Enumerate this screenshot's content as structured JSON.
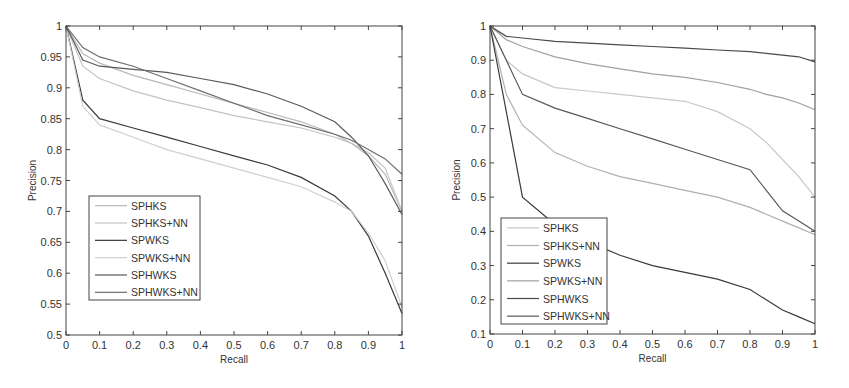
{
  "chart_data": [
    {
      "type": "line",
      "title": "",
      "xlabel": "Recall",
      "ylabel": "Precision",
      "xlim": [
        0,
        1
      ],
      "ylim": [
        0.5,
        1
      ],
      "grid": false,
      "legend_position": "lower left",
      "x": [
        0,
        0.05,
        0.1,
        0.2,
        0.3,
        0.4,
        0.5,
        0.6,
        0.7,
        0.8,
        0.85,
        0.9,
        0.95,
        1.0
      ],
      "xticks": [
        "0",
        "0.1",
        "0.2",
        "0.3",
        "0.4",
        "0.5",
        "0.6",
        "0.7",
        "0.8",
        "0.9",
        "1"
      ],
      "yticks": [
        "0.5",
        "0.55",
        "0.6",
        "0.65",
        "0.7",
        "0.75",
        "0.8",
        "0.85",
        "0.9",
        "0.95",
        "1"
      ],
      "series": [
        {
          "name": "SPHKS",
          "color": "#b8b8b8",
          "values": [
            1.0,
            0.955,
            0.94,
            0.92,
            0.905,
            0.89,
            0.875,
            0.86,
            0.845,
            0.825,
            0.81,
            0.79,
            0.76,
            0.7
          ]
        },
        {
          "name": "SPHKS+NN",
          "color": "#c4c4c4",
          "values": [
            1.0,
            0.935,
            0.915,
            0.895,
            0.88,
            0.868,
            0.855,
            0.845,
            0.835,
            0.82,
            0.81,
            0.795,
            0.77,
            0.7
          ]
        },
        {
          "name": "SPWKS",
          "color": "#3a3a3a",
          "values": [
            1.0,
            0.88,
            0.85,
            0.835,
            0.82,
            0.805,
            0.79,
            0.775,
            0.755,
            0.725,
            0.7,
            0.66,
            0.6,
            0.535
          ]
        },
        {
          "name": "SPWKS+NN",
          "color": "#cfcfcf",
          "values": [
            1.0,
            0.87,
            0.84,
            0.82,
            0.8,
            0.785,
            0.77,
            0.755,
            0.74,
            0.715,
            0.7,
            0.665,
            0.62,
            0.545
          ]
        },
        {
          "name": "SPHWKS",
          "color": "#5a5a5a",
          "values": [
            1.0,
            0.945,
            0.935,
            0.93,
            0.925,
            0.915,
            0.905,
            0.89,
            0.87,
            0.845,
            0.82,
            0.79,
            0.745,
            0.695
          ]
        },
        {
          "name": "SPHWKS+NN",
          "color": "#6e6e6e",
          "values": [
            1.0,
            0.965,
            0.95,
            0.935,
            0.915,
            0.895,
            0.875,
            0.855,
            0.84,
            0.825,
            0.815,
            0.8,
            0.785,
            0.76
          ]
        }
      ],
      "legend": [
        "SPHKS",
        "SPHKS+NN",
        "SPWKS",
        "SPWKS+NN",
        "SPHWKS",
        "SPHWKS+NN"
      ]
    },
    {
      "type": "line",
      "title": "",
      "xlabel": "Recall",
      "ylabel": "Precision",
      "xlim": [
        0,
        1
      ],
      "ylim": [
        0.1,
        1
      ],
      "grid": false,
      "legend_position": "lower left",
      "x": [
        0,
        0.05,
        0.1,
        0.2,
        0.3,
        0.4,
        0.5,
        0.6,
        0.7,
        0.8,
        0.85,
        0.9,
        0.95,
        1.0
      ],
      "xticks": [
        "0",
        "0.1",
        "0.2",
        "0.3",
        "0.4",
        "0.5",
        "0.6",
        "0.7",
        "0.8",
        "0.9",
        "1"
      ],
      "yticks": [
        "0.1",
        "0.2",
        "0.3",
        "0.4",
        "0.5",
        "0.6",
        "0.7",
        "0.8",
        "0.9",
        "1"
      ],
      "series": [
        {
          "name": "SPHKS",
          "color": "#c8c8c8",
          "values": [
            1.0,
            0.9,
            0.86,
            0.82,
            0.81,
            0.8,
            0.79,
            0.78,
            0.75,
            0.7,
            0.66,
            0.61,
            0.56,
            0.5
          ]
        },
        {
          "name": "SPHKS+NN",
          "color": "#b0b0b0",
          "values": [
            1.0,
            0.8,
            0.71,
            0.63,
            0.59,
            0.56,
            0.54,
            0.52,
            0.5,
            0.47,
            0.45,
            0.43,
            0.41,
            0.39
          ]
        },
        {
          "name": "SPWKS",
          "color": "#3a3a3a",
          "values": [
            1.0,
            0.75,
            0.5,
            0.42,
            0.37,
            0.33,
            0.3,
            0.28,
            0.26,
            0.23,
            0.2,
            0.17,
            0.15,
            0.13
          ]
        },
        {
          "name": "SPWKS+NN",
          "color": "#a0a0a0",
          "values": [
            1.0,
            0.96,
            0.94,
            0.91,
            0.89,
            0.875,
            0.86,
            0.85,
            0.835,
            0.815,
            0.8,
            0.79,
            0.775,
            0.755
          ]
        },
        {
          "name": "SPHWKS",
          "color": "#4a4a4a",
          "values": [
            1.0,
            0.97,
            0.965,
            0.955,
            0.95,
            0.945,
            0.94,
            0.935,
            0.93,
            0.925,
            0.92,
            0.915,
            0.91,
            0.895
          ]
        },
        {
          "name": "SPHWKS+NN",
          "color": "#585858",
          "values": [
            1.0,
            0.9,
            0.8,
            0.76,
            0.73,
            0.7,
            0.67,
            0.64,
            0.61,
            0.58,
            0.52,
            0.46,
            0.43,
            0.4
          ]
        }
      ],
      "legend": [
        "SPHKS",
        "SPHKS+NN",
        "SPWKS",
        "SPWKS+NN",
        "SPHWKS",
        "SPHWKS+NN"
      ]
    }
  ],
  "charts": [
    {
      "xlabel": "Recall",
      "ylabel": "Precision"
    },
    {
      "xlabel": "Recall",
      "ylabel": "Precision"
    }
  ]
}
